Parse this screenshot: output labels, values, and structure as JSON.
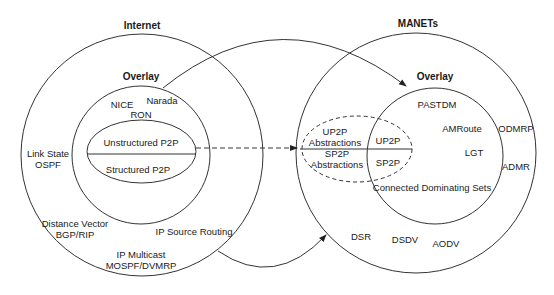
{
  "internet": {
    "title": "Internet",
    "overlay_title": "Overlay",
    "overlay_items": [
      "NICE",
      "Narada",
      "RON"
    ],
    "p2p": {
      "top": "Unstructured P2P",
      "bottom": "Structured P2P"
    },
    "routing": {
      "link_state": [
        "Link State",
        "OSPF"
      ],
      "distance_vector": [
        "Distance Vector",
        "BGP/RIP"
      ],
      "source_routing": "IP Source Routing",
      "multicast": [
        "IP Multicast",
        "MOSPF/DVMRP"
      ]
    }
  },
  "manets": {
    "title": "MANETs",
    "overlay_title": "Overlay",
    "overlay_items": [
      "PASTDM",
      "AMRoute",
      "LGT",
      "Connected Dominating Sets"
    ],
    "p2p": {
      "top": "UP2P",
      "bottom": "SP2P"
    },
    "abstractions": {
      "top": [
        "UP2P",
        "Abstractions"
      ],
      "bottom": [
        "SP2P",
        "Abstractions"
      ]
    },
    "routing": [
      "ODMRP",
      "ADMR",
      "DSR",
      "DSDV",
      "AODV"
    ]
  },
  "colors": {
    "stroke": "#333333",
    "text": "#1a1a1a",
    "background": "#ffffff"
  }
}
